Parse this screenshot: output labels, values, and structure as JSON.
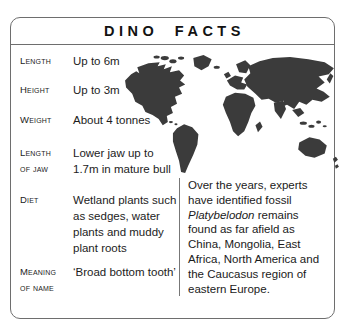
{
  "title": "DINO FACTS",
  "colors": {
    "map_fill": "#3b3b3b",
    "border": "#6e6e6e",
    "text": "#1c1c1c"
  },
  "facts": {
    "items": [
      {
        "label": "Length",
        "value": "Up to 6m"
      },
      {
        "label": "Height",
        "value": "Up to 3m"
      },
      {
        "label": "Weight",
        "value": "About 4 tonnes"
      },
      {
        "label": "Length\nof jaw",
        "value": "Lower jaw up to\n1.7m in mature bull"
      },
      {
        "label": "Diet",
        "value": "Wetland plants such\nas sedges, water\nplants and muddy\nplant roots"
      },
      {
        "label": "Meaning\nof name",
        "value": "‘Broad bottom tooth’"
      }
    ]
  },
  "map": {
    "description": "world-map-silhouette"
  },
  "right_panel": {
    "lines": [
      {
        "italic": "",
        "text": "Over the years, experts"
      },
      {
        "italic": "",
        "text": "have identified fossil"
      },
      {
        "italic": "Platybelodon",
        "text": " remains"
      },
      {
        "italic": "",
        "text": "found as far afield as"
      },
      {
        "italic": "",
        "text": "China, Mongolia, East"
      },
      {
        "italic": "",
        "text": "Africa, North America and"
      },
      {
        "italic": "",
        "text": "the Caucasus region of"
      },
      {
        "italic": "",
        "text": "eastern Europe."
      }
    ]
  }
}
